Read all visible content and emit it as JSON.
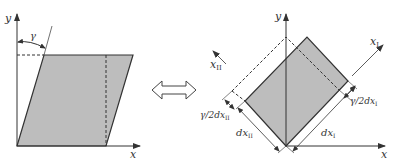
{
  "figure": {
    "left_panel": {
      "axis_x_label": "x",
      "axis_y_label": "y",
      "angle_label": "γ",
      "description": "sheared parallelogram (simple shear)"
    },
    "equivalence_symbol": "double-arrow",
    "right_panel": {
      "axis_x_label": "x",
      "axis_y_label": "y",
      "principal_axis_1_label": "x",
      "principal_axis_1_sub": "I",
      "principal_axis_2_label": "x",
      "principal_axis_2_sub": "II",
      "dim_1_label": "dx",
      "dim_1_sub": "I",
      "dim_2_label": "dx",
      "dim_2_sub": "II",
      "strain_1_label": "γ/2dx",
      "strain_1_sub": "I",
      "strain_2_label": "γ/2dx",
      "strain_2_sub": "II",
      "description": "rotated rectangle in principal axes (pure shear)"
    },
    "colors": {
      "fill": "#bdbdbd",
      "stroke": "#333333",
      "background": "#ffffff"
    }
  }
}
